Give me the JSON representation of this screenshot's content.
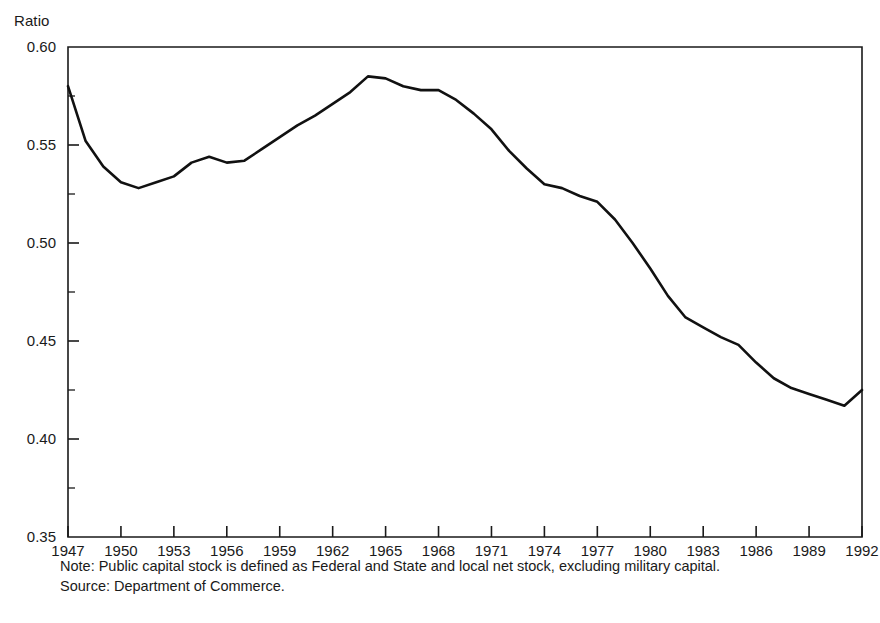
{
  "chart_data": {
    "type": "line",
    "title": "",
    "subtitle": "",
    "xlabel": "",
    "ylabel": "Ratio",
    "ylim": [
      0.35,
      0.6
    ],
    "xlim": [
      1947,
      1992
    ],
    "grid": false,
    "legend_position": "none",
    "y_tick_labels": [
      "0.60",
      "0.55",
      "0.50",
      "0.45",
      "0.40",
      "0.35"
    ],
    "y_tick_values": [
      0.6,
      0.55,
      0.5,
      0.45,
      0.4,
      0.35
    ],
    "y_minor_tick_values": [
      0.575,
      0.525,
      0.475,
      0.425,
      0.375
    ],
    "x_tick_labels": [
      "1947",
      "1950",
      "1953",
      "1956",
      "1959",
      "1962",
      "1965",
      "1968",
      "1971",
      "1974",
      "1977",
      "1980",
      "1983",
      "1986",
      "1989",
      "1992"
    ],
    "x_tick_values": [
      1947,
      1950,
      1953,
      1956,
      1959,
      1962,
      1965,
      1968,
      1971,
      1974,
      1977,
      1980,
      1983,
      1986,
      1989,
      1992
    ],
    "x": [
      1947,
      1948,
      1949,
      1950,
      1951,
      1952,
      1953,
      1954,
      1955,
      1956,
      1957,
      1958,
      1959,
      1960,
      1961,
      1962,
      1963,
      1964,
      1965,
      1966,
      1967,
      1968,
      1969,
      1970,
      1971,
      1972,
      1973,
      1974,
      1975,
      1976,
      1977,
      1978,
      1979,
      1980,
      1981,
      1982,
      1983,
      1984,
      1985,
      1986,
      1987,
      1988,
      1989,
      1990,
      1991,
      1992
    ],
    "values": [
      0.58,
      0.552,
      0.539,
      0.531,
      0.528,
      0.531,
      0.534,
      0.541,
      0.544,
      0.541,
      0.542,
      0.548,
      0.554,
      0.56,
      0.565,
      0.571,
      0.577,
      0.585,
      0.584,
      0.58,
      0.578,
      0.578,
      0.573,
      0.566,
      0.558,
      0.547,
      0.538,
      0.53,
      0.528,
      0.524,
      0.521,
      0.512,
      0.5,
      0.487,
      0.473,
      0.462,
      0.457,
      0.452,
      0.448,
      0.439,
      0.431,
      0.426,
      0.423,
      0.42,
      0.417,
      0.425
    ],
    "series_name": "Public capital stock ratio",
    "annotations": []
  },
  "footnotes": {
    "note": "Note: Public capital stock is defined as Federal and State and local net stock,  excluding military capital.",
    "source": "Source: Department of Commerce."
  }
}
